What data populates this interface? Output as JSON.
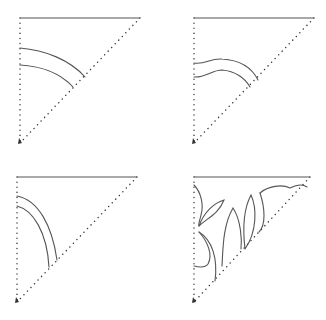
{
  "figure": {
    "line_color": "#555555",
    "dot_color": "#333333",
    "background": "#ffffff"
  },
  "panels": [
    {
      "id": "top-left",
      "label": "Concentric arc cuts",
      "triangle": {
        "top_left": [
          20,
          18
        ],
        "top_right": [
          140,
          18
        ],
        "bottom": [
          20,
          143
        ]
      },
      "cuts": [
        "M20 48 C 45 50, 70 60, 85 77",
        "M20 65 C 40 66, 60 73, 73 87"
      ]
    },
    {
      "id": "top-right",
      "label": "Wavy arc cuts",
      "triangle": {
        "top_left": [
          194,
          18
        ],
        "top_right": [
          314,
          18
        ],
        "bottom": [
          194,
          143
        ]
      },
      "cuts": [
        "M194 63 C 205 65, 210 58, 222 59 C 240 60, 252 68, 258 80",
        "M194 77 C 205 78, 212 70, 222 70 C 235 71, 245 78, 250 87"
      ]
    },
    {
      "id": "bottom-left",
      "label": "Quarter arc cuts",
      "triangle": {
        "top_left": [
          17,
          177
        ],
        "top_right": [
          137,
          177
        ],
        "bottom": [
          17,
          302
        ]
      },
      "cuts": [
        "M17 196 C 38 200, 52 225, 57 260",
        "M17 206 C 33 210, 47 232, 49 267"
      ]
    },
    {
      "id": "bottom-right",
      "label": "Leaf pattern cuts",
      "triangle": {
        "top_left": [
          194,
          177
        ],
        "top_right": [
          310,
          177
        ],
        "bottom": [
          194,
          302
        ]
      },
      "cuts": [
        "M194 185 C 205 195, 205 215, 199 225 C 212 218, 222 215, 225 199 C 215 203, 205 210, 199 225",
        "M199 226 C 208 238, 215 255, 207 266 C 202 268, 197 266, 194 266",
        "M198 234 C 210 242, 218 258, 215 281",
        "M203 224 C 212 236, 220 252, 222 266 C 227 264, 232 260, 233 258",
        "M233 206 C 225 220, 225 248, 226 267",
        "M233 206 C 242 218, 243 240, 241 248",
        "M251 195 C 244 206, 242 230, 245 249 C 253 240, 256 222, 255 210 C 254 202, 252 197, 251 195",
        "M260 193 C 267 210, 268 225, 262 232",
        "M260 193 C 270 186, 285 183, 292 189 C 298 185, 303 183, 307 187"
      ]
    }
  ]
}
